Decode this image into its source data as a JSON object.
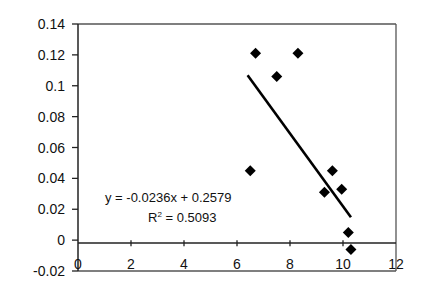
{
  "chart_data": {
    "type": "scatter",
    "title": "",
    "xlabel": "",
    "ylabel": "",
    "xlim": [
      0,
      12
    ],
    "ylim": [
      -0.02,
      0.14
    ],
    "x_ticks": [
      "0",
      "2",
      "4",
      "6",
      "8",
      "10",
      "12"
    ],
    "y_ticks": [
      "0.14",
      "0.12",
      "0.1",
      "0.08",
      "0.06",
      "0.04",
      "0.02",
      "0",
      "-0.02"
    ],
    "grid": false,
    "legend": "none",
    "series": [
      {
        "name": "data",
        "marker": "diamond",
        "color": "#000000",
        "points": [
          {
            "x": 6.7,
            "y": 0.121
          },
          {
            "x": 8.3,
            "y": 0.121
          },
          {
            "x": 7.5,
            "y": 0.106
          },
          {
            "x": 6.5,
            "y": 0.045
          },
          {
            "x": 9.6,
            "y": 0.045
          },
          {
            "x": 9.3,
            "y": 0.031
          },
          {
            "x": 9.95,
            "y": 0.033
          },
          {
            "x": 10.2,
            "y": 0.005
          },
          {
            "x": 10.3,
            "y": -0.006
          }
        ]
      }
    ],
    "trendline": {
      "type": "linear",
      "slope": -0.0236,
      "intercept": 0.2579,
      "x_range": [
        6.4,
        10.3
      ],
      "equation_label": "y = -0.0236x + 0.2579",
      "r2_prefix": "R",
      "r2_superscript": "2",
      "r2_value_label": " = 0.5093"
    }
  }
}
